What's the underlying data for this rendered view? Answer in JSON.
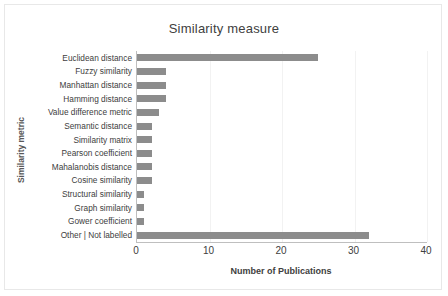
{
  "chart_data": {
    "type": "bar",
    "orientation": "horizontal",
    "title": "Similarity measure",
    "xlabel": "Number of Publications",
    "ylabel": "Similarity metric",
    "xlim": [
      0,
      40
    ],
    "xticks": [
      0,
      10,
      20,
      30,
      40
    ],
    "grid": "vertical-light",
    "legend": "none",
    "bar_color": "#8c8c8c",
    "categories": [
      "Euclidean distance",
      "Fuzzy similarity",
      "Manhattan distance",
      "Hamming distance",
      "Value difference metric",
      "Semantic distance",
      "Similarity matrix",
      "Pearson coefficient",
      "Mahalanobis distance",
      "Cosine similarity",
      "Structural similarity",
      "Graph similarity",
      "Gower coefficient",
      "Other | Not labelled"
    ],
    "values": [
      25,
      4,
      4,
      4,
      3,
      2,
      2,
      2,
      2,
      2,
      1,
      1,
      1,
      32
    ]
  },
  "frame": {
    "border_color": "#e8e8e8",
    "background": "#ffffff"
  }
}
